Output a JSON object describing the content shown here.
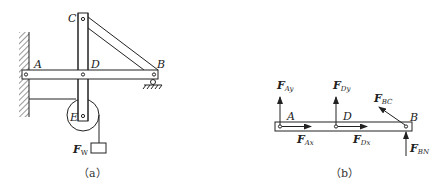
{
  "figure_a": {
    "caption": "（a）",
    "points": {
      "A": "A",
      "B": "B",
      "C": "C",
      "D": "D",
      "E": "E"
    },
    "weight": {
      "symbol": "F",
      "subscript": "W"
    }
  },
  "figure_b": {
    "caption": "（b）",
    "points": {
      "A": "A",
      "B": "B",
      "D": "D"
    },
    "forces": {
      "F_Ay": {
        "symbol": "F",
        "subscript": "Ay"
      },
      "F_Ax": {
        "symbol": "F",
        "subscript": "Ax"
      },
      "F_Dy": {
        "symbol": "F",
        "subscript": "Dy"
      },
      "F_Dx": {
        "symbol": "F",
        "subscript": "Dx"
      },
      "F_BC": {
        "symbol": "F",
        "subscript": "BC"
      },
      "F_BN": {
        "symbol": "F",
        "subscript": "BN"
      }
    }
  },
  "colors": {
    "line": "#222222",
    "background": "#ffffff"
  }
}
